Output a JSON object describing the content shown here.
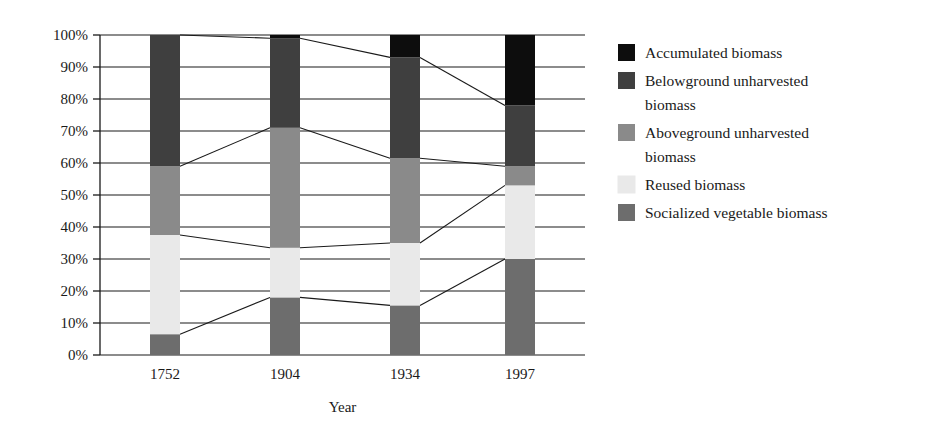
{
  "chart_data": {
    "type": "bar",
    "subtype": "stacked-percentage",
    "title": "",
    "xlabel": "Year",
    "ylabel": "",
    "categories": [
      "1752",
      "1904",
      "1934",
      "1997"
    ],
    "ylim": [
      0,
      100
    ],
    "ytick_labels": [
      "0%",
      "10%",
      "20%",
      "30%",
      "40%",
      "50%",
      "60%",
      "70%",
      "80%",
      "90%",
      "100%"
    ],
    "ytick_values": [
      0,
      10,
      20,
      30,
      40,
      50,
      60,
      70,
      80,
      90,
      100
    ],
    "grid": true,
    "legend_position": "right",
    "stack_order_bottom_to_top": [
      "Socialized vegetable biomass",
      "Reused biomass",
      "Aboveground unharvested biomass",
      "Belowground unharvested biomass",
      "Accumulated biomass"
    ],
    "series": [
      {
        "name": "Accumulated biomass",
        "color": "#0d0d0d",
        "values": [
          0,
          1.0,
          7.0,
          22.0
        ]
      },
      {
        "name": "Belowground unharvested biomass",
        "color": "#3f3f3f",
        "values": [
          41.0,
          28.0,
          31.5,
          19.0
        ]
      },
      {
        "name": "Aboveground unharvested biomass",
        "color": "#8a8a8a",
        "values": [
          21.5,
          37.5,
          26.5,
          6.0
        ]
      },
      {
        "name": "Reused biomass",
        "color": "#e9e9e9",
        "values": [
          31.0,
          15.5,
          19.5,
          23.0
        ]
      },
      {
        "name": "Socialized vegetable biomass",
        "color": "#6d6d6d",
        "values": [
          6.5,
          18.0,
          15.5,
          30.0
        ]
      }
    ],
    "cumulative_boundaries": {
      "1752": [
        0,
        6.5,
        37.5,
        59.0,
        100.0,
        100.0
      ],
      "1904": [
        0,
        18.0,
        33.5,
        71.0,
        99.0,
        100.0
      ],
      "1934": [
        0,
        15.5,
        35.0,
        61.5,
        93.0,
        100.0
      ],
      "1997": [
        0,
        30.0,
        53.0,
        59.0,
        78.0,
        100.0
      ]
    }
  },
  "legend": {
    "items": [
      {
        "label": "Accumulated biomass",
        "color": "#0d0d0d"
      },
      {
        "label": "Belowground unharvested biomass",
        "color": "#3f3f3f"
      },
      {
        "label": "Aboveground unharvested biomass",
        "color": "#8a8a8a"
      },
      {
        "label": "Reused biomass",
        "color": "#e9e9e9"
      },
      {
        "label": "Socialized vegetable biomass",
        "color": "#6d6d6d"
      }
    ],
    "item_lines": [
      [
        "Accumulated biomass"
      ],
      [
        "Belowground unharvested",
        "biomass"
      ],
      [
        "Aboveground unharvested",
        "biomass"
      ],
      [
        "Reused biomass"
      ],
      [
        "Socialized vegetable biomass"
      ]
    ]
  },
  "axes": {
    "x_title": "Year",
    "y_ticks": [
      "100%",
      "90%",
      "80%",
      "70%",
      "60%",
      "50%",
      "40%",
      "30%",
      "20%",
      "10%",
      "0%"
    ],
    "x_ticks": [
      "1752",
      "1904",
      "1934",
      "1997"
    ]
  }
}
